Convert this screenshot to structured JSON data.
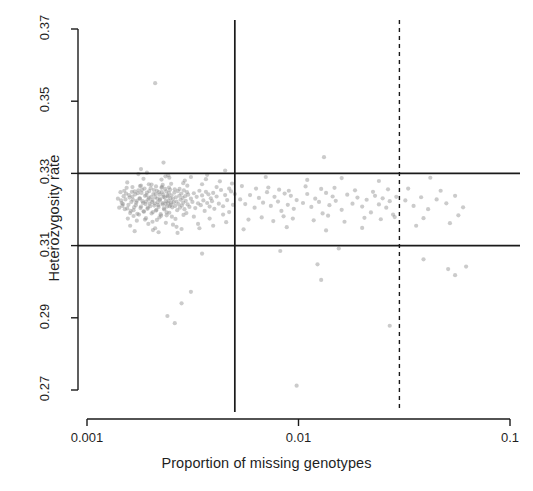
{
  "chart_data": {
    "type": "scatter",
    "title": "",
    "xlabel": "Proportion of missing genotypes",
    "ylabel": "Heterozygosity rate",
    "xscale": "log",
    "yscale": "linear",
    "xlim": [
      0.001,
      0.1
    ],
    "ylim": [
      0.27,
      0.37
    ],
    "xticks": [
      0.001,
      0.01,
      0.1
    ],
    "xticklabels": [
      "0.001",
      "0.01",
      "0.1"
    ],
    "yticks": [
      0.27,
      0.29,
      0.31,
      0.33,
      0.35,
      0.37
    ],
    "yticklabels": [
      "0.27",
      "0.29",
      "0.31",
      "0.33",
      "0.35",
      "0.37"
    ],
    "grid": false,
    "legend": null,
    "point_color": "#8c8c8c",
    "point_opacity": 0.45,
    "point_radius": 2.1,
    "reference_lines": [
      {
        "name": "heterozygosity-upper-threshold",
        "orientation": "horizontal",
        "value": 0.33,
        "style": "solid",
        "color": "#1a1a1a"
      },
      {
        "name": "heterozygosity-lower-threshold",
        "orientation": "horizontal",
        "value": 0.31,
        "style": "solid",
        "color": "#1a1a1a"
      },
      {
        "name": "missingness-threshold-solid",
        "orientation": "vertical",
        "value": 0.005,
        "style": "solid",
        "color": "#1a1a1a"
      },
      {
        "name": "missingness-threshold-dashed",
        "orientation": "vertical",
        "value": 0.03,
        "style": "dashed",
        "color": "#1a1a1a"
      }
    ],
    "points": [
      [
        0.00148,
        0.3215
      ],
      [
        0.00152,
        0.3228
      ],
      [
        0.00155,
        0.3203
      ],
      [
        0.00158,
        0.324
      ],
      [
        0.0016,
        0.319
      ],
      [
        0.00162,
        0.3221
      ],
      [
        0.00164,
        0.3236
      ],
      [
        0.00166,
        0.3198
      ],
      [
        0.00168,
        0.325
      ],
      [
        0.0017,
        0.3212
      ],
      [
        0.00172,
        0.3224
      ],
      [
        0.00174,
        0.3245
      ],
      [
        0.00176,
        0.3186
      ],
      [
        0.00178,
        0.323
      ],
      [
        0.0018,
        0.3208
      ],
      [
        0.00182,
        0.3255
      ],
      [
        0.00184,
        0.3218
      ],
      [
        0.00186,
        0.3194
      ],
      [
        0.00188,
        0.3238
      ],
      [
        0.0019,
        0.3222
      ],
      [
        0.00192,
        0.3247
      ],
      [
        0.00194,
        0.3205
      ],
      [
        0.00196,
        0.3232
      ],
      [
        0.00198,
        0.3216
      ],
      [
        0.002,
        0.3259
      ],
      [
        0.00202,
        0.3189
      ],
      [
        0.00204,
        0.3226
      ],
      [
        0.00206,
        0.3243
      ],
      [
        0.00208,
        0.3211
      ],
      [
        0.0021,
        0.3234
      ],
      [
        0.00212,
        0.3197
      ],
      [
        0.00214,
        0.3252
      ],
      [
        0.00216,
        0.322
      ],
      [
        0.00218,
        0.3207
      ],
      [
        0.0022,
        0.3241
      ],
      [
        0.00222,
        0.3229
      ],
      [
        0.00224,
        0.3183
      ],
      [
        0.00226,
        0.3248
      ],
      [
        0.00228,
        0.3214
      ],
      [
        0.0023,
        0.3235
      ],
      [
        0.00232,
        0.32
      ],
      [
        0.00234,
        0.3257
      ],
      [
        0.00236,
        0.3223
      ],
      [
        0.00238,
        0.3192
      ],
      [
        0.0024,
        0.3239
      ],
      [
        0.00242,
        0.3217
      ],
      [
        0.00244,
        0.3246
      ],
      [
        0.00246,
        0.3209
      ],
      [
        0.00248,
        0.3231
      ],
      [
        0.0025,
        0.3219
      ],
      [
        0.0015,
        0.3252
      ],
      [
        0.00156,
        0.3175
      ],
      [
        0.00164,
        0.3262
      ],
      [
        0.00172,
        0.3169
      ],
      [
        0.0018,
        0.3266
      ],
      [
        0.00188,
        0.3172
      ],
      [
        0.00196,
        0.327
      ],
      [
        0.00204,
        0.3166
      ],
      [
        0.00212,
        0.3264
      ],
      [
        0.0022,
        0.3178
      ],
      [
        0.00228,
        0.3268
      ],
      [
        0.00236,
        0.3163
      ],
      [
        0.00244,
        0.3261
      ],
      [
        0.00252,
        0.318
      ],
      [
        0.0026,
        0.3256
      ],
      [
        0.00145,
        0.3225
      ],
      [
        0.00147,
        0.321
      ],
      [
        0.00149,
        0.3237
      ],
      [
        0.00151,
        0.3201
      ],
      [
        0.00153,
        0.3244
      ],
      [
        0.00157,
        0.3213
      ],
      [
        0.00159,
        0.3233
      ],
      [
        0.00161,
        0.3196
      ],
      [
        0.00163,
        0.3249
      ],
      [
        0.00165,
        0.3227
      ],
      [
        0.00167,
        0.3206
      ],
      [
        0.00169,
        0.3242
      ],
      [
        0.00171,
        0.3219
      ],
      [
        0.00173,
        0.3188
      ],
      [
        0.00175,
        0.3253
      ],
      [
        0.00177,
        0.3231
      ],
      [
        0.00179,
        0.3204
      ],
      [
        0.00181,
        0.3246
      ],
      [
        0.00183,
        0.3223
      ],
      [
        0.00185,
        0.3195
      ],
      [
        0.00187,
        0.3258
      ],
      [
        0.00189,
        0.3215
      ],
      [
        0.00191,
        0.324
      ],
      [
        0.00193,
        0.3202
      ],
      [
        0.00195,
        0.3228
      ],
      [
        0.00197,
        0.3251
      ],
      [
        0.00199,
        0.3209
      ],
      [
        0.00201,
        0.3235
      ],
      [
        0.00203,
        0.3221
      ],
      [
        0.00205,
        0.3193
      ],
      [
        0.00207,
        0.3254
      ],
      [
        0.00209,
        0.3217
      ],
      [
        0.00211,
        0.3243
      ],
      [
        0.00213,
        0.3199
      ],
      [
        0.00215,
        0.323
      ],
      [
        0.00217,
        0.3212
      ],
      [
        0.00219,
        0.3248
      ],
      [
        0.00221,
        0.3226
      ],
      [
        0.00223,
        0.3187
      ],
      [
        0.00225,
        0.326
      ],
      [
        0.00227,
        0.3218
      ],
      [
        0.00229,
        0.3241
      ],
      [
        0.00231,
        0.3203
      ],
      [
        0.00233,
        0.3233
      ],
      [
        0.00235,
        0.3216
      ],
      [
        0.00237,
        0.325
      ],
      [
        0.00239,
        0.3208
      ],
      [
        0.00241,
        0.3236
      ],
      [
        0.00243,
        0.3224
      ],
      [
        0.00245,
        0.3191
      ],
      [
        0.00247,
        0.3255
      ],
      [
        0.00249,
        0.3213
      ],
      [
        0.00251,
        0.3239
      ],
      [
        0.00253,
        0.3206
      ],
      [
        0.00255,
        0.3229
      ],
      [
        0.00257,
        0.322
      ],
      [
        0.00259,
        0.3247
      ],
      [
        0.00261,
        0.321
      ],
      [
        0.00263,
        0.3234
      ],
      [
        0.00265,
        0.3222
      ],
      [
        0.00267,
        0.3198
      ],
      [
        0.00269,
        0.3251
      ],
      [
        0.00271,
        0.3215
      ],
      [
        0.00273,
        0.3238
      ],
      [
        0.00275,
        0.3205
      ],
      [
        0.00277,
        0.3227
      ],
      [
        0.00279,
        0.3244
      ],
      [
        0.00281,
        0.3211
      ],
      [
        0.00283,
        0.3232
      ],
      [
        0.00285,
        0.3219
      ],
      [
        0.00287,
        0.3253
      ],
      [
        0.00289,
        0.3201
      ],
      [
        0.00291,
        0.3237
      ],
      [
        0.00293,
        0.3224
      ],
      [
        0.00295,
        0.319
      ],
      [
        0.00297,
        0.3248
      ],
      [
        0.00299,
        0.3214
      ],
      [
        0.00301,
        0.3241
      ],
      [
        0.00305,
        0.3207
      ],
      [
        0.0031,
        0.323
      ],
      [
        0.00315,
        0.3221
      ],
      [
        0.0032,
        0.3245
      ],
      [
        0.00325,
        0.3204
      ],
      [
        0.0033,
        0.3235
      ],
      [
        0.00335,
        0.3217
      ],
      [
        0.0034,
        0.3252
      ],
      [
        0.00345,
        0.3212
      ],
      [
        0.0035,
        0.3239
      ],
      [
        0.00355,
        0.3225
      ],
      [
        0.0036,
        0.3196
      ],
      [
        0.00365,
        0.3249
      ],
      [
        0.0037,
        0.3218
      ],
      [
        0.00375,
        0.3242
      ],
      [
        0.0038,
        0.3208
      ],
      [
        0.00385,
        0.3231
      ],
      [
        0.0039,
        0.3223
      ],
      [
        0.00395,
        0.3246
      ],
      [
        0.004,
        0.3202
      ],
      [
        0.0041,
        0.3236
      ],
      [
        0.0042,
        0.3216
      ],
      [
        0.0043,
        0.3254
      ],
      [
        0.0044,
        0.3209
      ],
      [
        0.0045,
        0.324
      ],
      [
        0.0046,
        0.3226
      ],
      [
        0.0047,
        0.3193
      ],
      [
        0.0048,
        0.325
      ],
      [
        0.0049,
        0.3213
      ],
      [
        0.005,
        0.3243
      ],
      [
        0.0014,
        0.323
      ],
      [
        0.00142,
        0.3205
      ],
      [
        0.00144,
        0.3248
      ],
      [
        0.00146,
        0.3218
      ],
      [
        0.00154,
        0.326
      ],
      [
        0.00166,
        0.3182
      ],
      [
        0.00178,
        0.3265
      ],
      [
        0.0019,
        0.3176
      ],
      [
        0.00202,
        0.3269
      ],
      [
        0.00214,
        0.3171
      ],
      [
        0.00226,
        0.3263
      ],
      [
        0.00238,
        0.3184
      ],
      [
        0.0025,
        0.3271
      ],
      [
        0.00262,
        0.3174
      ],
      [
        0.00274,
        0.3257
      ],
      [
        0.00286,
        0.3185
      ],
      [
        0.00298,
        0.3266
      ],
      [
        0.0016,
        0.3155
      ],
      [
        0.00185,
        0.3285
      ],
      [
        0.0021,
        0.3148
      ],
      [
        0.00235,
        0.3292
      ],
      [
        0.00265,
        0.3152
      ],
      [
        0.0029,
        0.328
      ],
      [
        0.00175,
        0.3298
      ],
      [
        0.00205,
        0.3143
      ],
      [
        0.00245,
        0.3288
      ],
      [
        0.0028,
        0.3146
      ],
      [
        0.00155,
        0.3275
      ],
      [
        0.00195,
        0.316
      ],
      [
        0.00225,
        0.3283
      ],
      [
        0.00255,
        0.3158
      ],
      [
        0.00285,
        0.3273
      ],
      [
        0.00168,
        0.314
      ],
      [
        0.00192,
        0.3302
      ],
      [
        0.00218,
        0.3137
      ],
      [
        0.00242,
        0.3295
      ],
      [
        0.00268,
        0.3135
      ],
      [
        0.0032,
        0.318
      ],
      [
        0.0035,
        0.327
      ],
      [
        0.0038,
        0.3175
      ],
      [
        0.0041,
        0.3262
      ],
      [
        0.0044,
        0.3186
      ],
      [
        0.0047,
        0.3258
      ],
      [
        0.00335,
        0.316
      ],
      [
        0.00365,
        0.3284
      ],
      [
        0.00395,
        0.3155
      ],
      [
        0.00425,
        0.3278
      ],
      [
        0.00455,
        0.3165
      ],
      [
        0.00485,
        0.3272
      ],
      [
        0.0031,
        0.329
      ],
      [
        0.0034,
        0.3148
      ],
      [
        0.0037,
        0.3296
      ],
      [
        0.0053,
        0.3228
      ],
      [
        0.0056,
        0.3215
      ],
      [
        0.0059,
        0.324
      ],
      [
        0.0062,
        0.3205
      ],
      [
        0.0065,
        0.3232
      ],
      [
        0.0068,
        0.3219
      ],
      [
        0.0071,
        0.3248
      ],
      [
        0.0074,
        0.321
      ],
      [
        0.0077,
        0.3235
      ],
      [
        0.008,
        0.3222
      ],
      [
        0.0083,
        0.3196
      ],
      [
        0.0086,
        0.3244
      ],
      [
        0.0089,
        0.3213
      ],
      [
        0.0092,
        0.3238
      ],
      [
        0.0095,
        0.3202
      ],
      [
        0.0098,
        0.3226
      ],
      [
        0.0105,
        0.3218
      ],
      [
        0.011,
        0.3243
      ],
      [
        0.0115,
        0.3207
      ],
      [
        0.012,
        0.323
      ],
      [
        0.0125,
        0.3221
      ],
      [
        0.013,
        0.3189
      ],
      [
        0.0135,
        0.3246
      ],
      [
        0.014,
        0.3212
      ],
      [
        0.0145,
        0.3236
      ],
      [
        0.015,
        0.3224
      ],
      [
        0.016,
        0.3199
      ],
      [
        0.017,
        0.3241
      ],
      [
        0.018,
        0.3216
      ],
      [
        0.019,
        0.3233
      ],
      [
        0.02,
        0.3208
      ],
      [
        0.021,
        0.3227
      ],
      [
        0.022,
        0.3192
      ],
      [
        0.023,
        0.3238
      ],
      [
        0.024,
        0.3214
      ],
      [
        0.025,
        0.3231
      ],
      [
        0.026,
        0.3205
      ],
      [
        0.027,
        0.3223
      ],
      [
        0.028,
        0.3186
      ],
      [
        0.029,
        0.3235
      ],
      [
        0.0054,
        0.3265
      ],
      [
        0.0058,
        0.3172
      ],
      [
        0.0063,
        0.3258
      ],
      [
        0.0067,
        0.3178
      ],
      [
        0.0072,
        0.3261
      ],
      [
        0.0076,
        0.3168
      ],
      [
        0.0081,
        0.3255
      ],
      [
        0.0085,
        0.3181
      ],
      [
        0.009,
        0.3252
      ],
      [
        0.0094,
        0.3175
      ],
      [
        0.0108,
        0.3264
      ],
      [
        0.0118,
        0.317
      ],
      [
        0.0128,
        0.3257
      ],
      [
        0.0138,
        0.3183
      ],
      [
        0.0148,
        0.326
      ],
      [
        0.0165,
        0.3166
      ],
      [
        0.0185,
        0.3253
      ],
      [
        0.0205,
        0.3177
      ],
      [
        0.0225,
        0.3249
      ],
      [
        0.0245,
        0.3173
      ],
      [
        0.0265,
        0.3256
      ],
      [
        0.0285,
        0.3179
      ],
      [
        0.0055,
        0.3145
      ],
      [
        0.007,
        0.329
      ],
      [
        0.0088,
        0.3151
      ],
      [
        0.011,
        0.3282
      ],
      [
        0.0135,
        0.3142
      ],
      [
        0.016,
        0.3287
      ],
      [
        0.02,
        0.3149
      ],
      [
        0.024,
        0.3279
      ],
      [
        0.032,
        0.3225
      ],
      [
        0.035,
        0.321
      ],
      [
        0.038,
        0.3234
      ],
      [
        0.041,
        0.3201
      ],
      [
        0.045,
        0.3228
      ],
      [
        0.05,
        0.3217
      ],
      [
        0.055,
        0.3238
      ],
      [
        0.06,
        0.3206
      ],
      [
        0.033,
        0.3258
      ],
      [
        0.039,
        0.3176
      ],
      [
        0.047,
        0.3252
      ],
      [
        0.057,
        0.3184
      ],
      [
        0.042,
        0.3288
      ],
      [
        0.036,
        0.3155
      ],
      [
        0.052,
        0.3162
      ],
      [
        0.0021,
        0.355
      ],
      [
        0.0023,
        0.333
      ],
      [
        0.0132,
        0.3345
      ],
      [
        0.0045,
        0.3308
      ],
      [
        0.0018,
        0.3312
      ],
      [
        0.0026,
        0.2885
      ],
      [
        0.0028,
        0.294
      ],
      [
        0.0031,
        0.2972
      ],
      [
        0.0024,
        0.2905
      ],
      [
        0.0123,
        0.3048
      ],
      [
        0.0128,
        0.3005
      ],
      [
        0.027,
        0.2878
      ],
      [
        0.039,
        0.3062
      ],
      [
        0.051,
        0.3035
      ],
      [
        0.062,
        0.3042
      ],
      [
        0.055,
        0.3018
      ],
      [
        0.0098,
        0.2712
      ],
      [
        0.0035,
        0.3078
      ],
      [
        0.0082,
        0.3085
      ],
      [
        0.0155,
        0.3092
      ]
    ]
  }
}
